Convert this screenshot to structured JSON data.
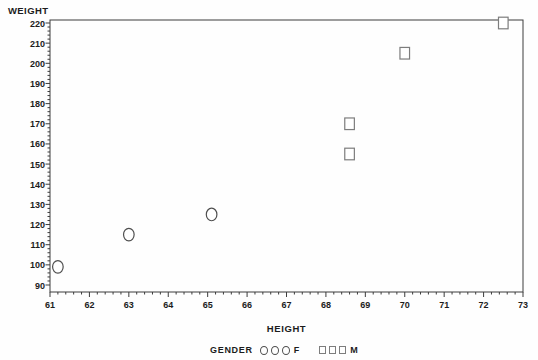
{
  "chart_data": {
    "type": "scatter",
    "title": "",
    "xlabel": "HEIGHT",
    "ylabel": "WEIGHT",
    "xlim": [
      61,
      73
    ],
    "ylim": [
      90,
      220
    ],
    "x_major_step": 1,
    "x_minor_step": 0.2,
    "y_major_step": 10,
    "y_minor_step": 2,
    "grid": false,
    "legend_position": "bottom-center",
    "series": [
      {
        "name": "F",
        "marker": "circle",
        "points": [
          [
            61.2,
            99
          ],
          [
            63.0,
            115
          ],
          [
            65.1,
            125
          ]
        ]
      },
      {
        "name": "M",
        "marker": "square",
        "points": [
          [
            68.6,
            155
          ],
          [
            68.6,
            170
          ],
          [
            70.0,
            205
          ],
          [
            72.5,
            220
          ]
        ]
      }
    ],
    "legend": {
      "title": "GENDER",
      "entries": [
        {
          "label": "F",
          "marker": "circle"
        },
        {
          "label": "M",
          "marker": "square"
        }
      ]
    },
    "colors": {
      "background": "#fefefe",
      "axis": "#3c3c3c",
      "text": "#1c1c1c",
      "circle_stroke": "#4f4f4f",
      "square_stroke": "#7d7d7d"
    }
  }
}
